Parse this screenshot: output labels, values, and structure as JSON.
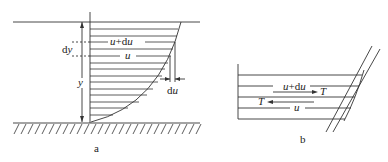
{
  "figure_a": {
    "caption": "a",
    "labels": {
      "dy_d": "d",
      "dy_y": "y",
      "y": "y",
      "upper_u": "u",
      "upper_plus_d": "+d",
      "upper_u2": "u",
      "lower_u": "u",
      "du_d": "d",
      "du_u": "u"
    }
  },
  "figure_b": {
    "caption": "b",
    "labels": {
      "upper_u": "u",
      "upper_plus_d": "+d",
      "upper_u2": "u",
      "upper_T": "T",
      "lower_T": "T",
      "lower_u": "u"
    }
  },
  "colors": {
    "line": "#333333",
    "background": "#ffffff"
  }
}
